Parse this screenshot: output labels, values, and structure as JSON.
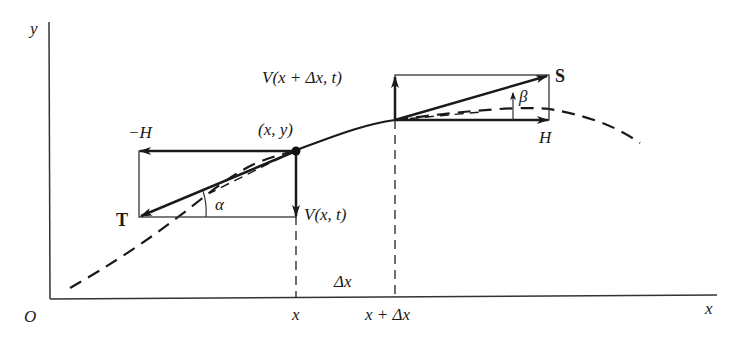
{
  "diagram": {
    "type": "string element force diagram",
    "axes": {
      "y_label": "y",
      "x_label": "x",
      "origin_label": "O"
    },
    "x_ticks": {
      "x": "x",
      "x_plus_dx": "x + Δx",
      "delta": "Δx"
    },
    "left_point": {
      "label": "(x, y)",
      "tension": "T",
      "horizontal": "−H",
      "vertical": "V(x, t)",
      "angle": "α"
    },
    "right_point": {
      "tension": "S",
      "horizontal": "H",
      "vertical": "V(x + Δx, t)",
      "angle": "β"
    }
  }
}
